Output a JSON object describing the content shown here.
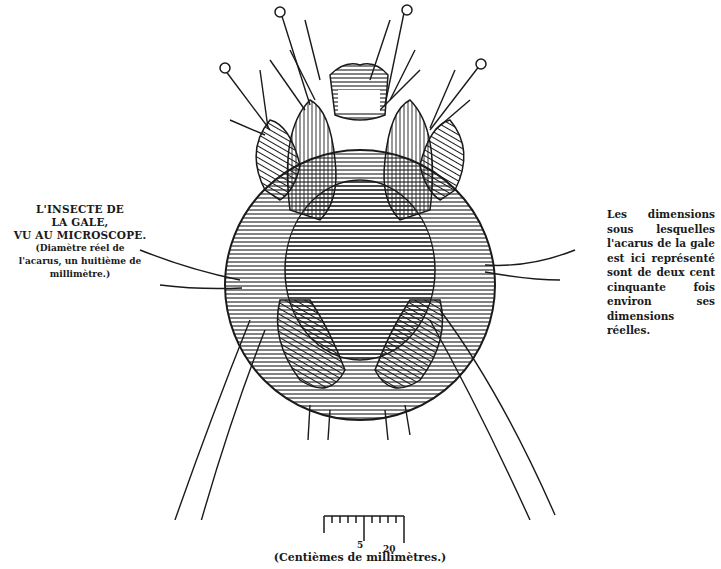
{
  "left_caption": {
    "title_lines": [
      "L'INSECTE DE",
      "LA GALE,",
      "VU AU MICROSCOPE."
    ],
    "note_lines": [
      "(Diamètre réel de",
      "l'acarus, un huitième de",
      "millimètre.)"
    ]
  },
  "right_caption": {
    "text": "Les dimensions sous lesquelles l'acarus de la gale est ici représenté sont de deux cent cinquante fois environ ses dimensions réelles."
  },
  "figure": {
    "ink_color": "#1a1a1a",
    "paper_color": "#ffffff"
  },
  "scale_bar": {
    "tick_labels": [
      "5",
      "20"
    ],
    "caption": "(Centièmes de millimètres.)"
  }
}
